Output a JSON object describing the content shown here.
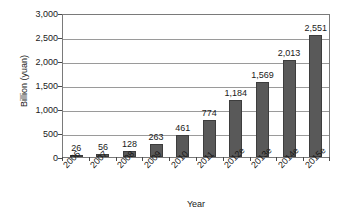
{
  "chart_data": {
    "type": "bar",
    "title": "",
    "xlabel": "Year",
    "ylabel": "Billion (yuan)",
    "categories": [
      "2006",
      "2007",
      "2008",
      "2009",
      "2010",
      "2011",
      "2012e",
      "2013e",
      "2014e",
      "2015e"
    ],
    "values": [
      26,
      56,
      128,
      263,
      461,
      774,
      1184,
      1569,
      2013,
      2551
    ],
    "value_labels": [
      "26",
      "56",
      "128",
      "263",
      "461",
      "774",
      "1,184",
      "1,569",
      "2,013",
      "2,551"
    ],
    "ylim": [
      0,
      3000
    ],
    "ytick_values": [
      0,
      500,
      1000,
      1500,
      2000,
      2500,
      3000
    ],
    "ytick_labels": [
      "0",
      "500",
      "1,000",
      "1,500",
      "2,000",
      "2,500",
      "3,000"
    ],
    "grid": true,
    "legend": "none",
    "bar_color": "#595959",
    "bar_border_color": "#3d3d3d",
    "gridline_color": "#9a9a9a",
    "axis_color": "#7a7a7a",
    "background_color": "#ffffff",
    "xtick_label_rotation": -45
  }
}
